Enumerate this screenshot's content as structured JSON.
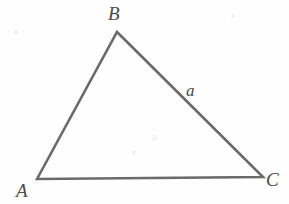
{
  "figure": {
    "type": "geometry-diagram",
    "shape": "triangle",
    "canvas": {
      "width": 289,
      "height": 204
    },
    "background_color": "#fefefe",
    "stroke_color": "#6a6a6a",
    "stroke_width": 2.6,
    "label_color": "#4a4a4a",
    "vertices": [
      {
        "name": "A",
        "label": "A",
        "x": 37,
        "y": 179,
        "label_x": 16,
        "label_y": 181
      },
      {
        "name": "B",
        "label": "B",
        "x": 117,
        "y": 32,
        "label_x": 108,
        "label_y": 4
      },
      {
        "name": "C",
        "label": "C",
        "x": 263,
        "y": 177,
        "label_x": 266,
        "label_y": 170
      }
    ],
    "sides": [
      {
        "name": "AB",
        "label": "",
        "from": "A",
        "to": "B"
      },
      {
        "name": "BC",
        "label": "a",
        "from": "B",
        "to": "C",
        "label_x": 186,
        "label_y": 82
      },
      {
        "name": "CA",
        "label": "",
        "from": "C",
        "to": "A"
      }
    ],
    "polygon_points": "37,179 117,32 263,177"
  },
  "labels": {
    "vertex_a": "A",
    "vertex_b": "B",
    "vertex_c": "C",
    "side_a": "a"
  }
}
